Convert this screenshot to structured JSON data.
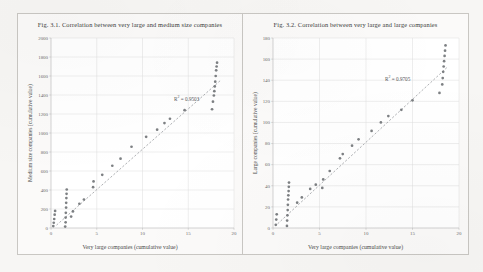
{
  "page": {
    "background_color": "#f7f6f4",
    "panel_background": "#fbfaf9",
    "panel_border_color": "#c9c7c3"
  },
  "figures": [
    {
      "id": "fig-3-1",
      "title": "Fig. 3.1. Correlation between very large and medium size companies",
      "r2_prefix": "R",
      "r2_sup": "2",
      "r2_value": " = 0.9503",
      "r2_text": "R² = 0.9503",
      "chart_data": {
        "type": "scatter",
        "title": "Fig. 3.1. Correlation between very large and medium size companies",
        "xlabel": "Very large companies (cumulative value)",
        "ylabel": "Medium size companies (cumulative value)",
        "xlim": [
          0,
          20
        ],
        "ylim": [
          0,
          2000
        ],
        "xticks": [
          0,
          5,
          10,
          15,
          20
        ],
        "yticks": [
          0,
          200,
          400,
          600,
          800,
          1000,
          1200,
          1400,
          1600,
          1800,
          2000
        ],
        "grid": true,
        "legend": "none",
        "marker_color": "#6f7276",
        "trendline": {
          "style": "dashed",
          "color": "#8c8f93",
          "x0": 0.6,
          "y0": 30,
          "x1": 18.6,
          "y1": 1560
        },
        "points": [
          [
            0.25,
            20
          ],
          [
            0.3,
            55
          ],
          [
            0.35,
            95
          ],
          [
            0.4,
            140
          ],
          [
            0.45,
            180
          ],
          [
            1.55,
            15
          ],
          [
            1.6,
            60
          ],
          [
            1.6,
            110
          ],
          [
            1.62,
            160
          ],
          [
            1.65,
            215
          ],
          [
            1.66,
            265
          ],
          [
            1.68,
            315
          ],
          [
            1.7,
            360
          ],
          [
            1.72,
            405
          ],
          [
            2.2,
            120
          ],
          [
            2.4,
            175
          ],
          [
            3.1,
            255
          ],
          [
            3.6,
            300
          ],
          [
            4.6,
            430
          ],
          [
            4.65,
            490
          ],
          [
            5.6,
            560
          ],
          [
            6.7,
            655
          ],
          [
            7.6,
            730
          ],
          [
            8.8,
            855
          ],
          [
            10.4,
            960
          ],
          [
            11.6,
            1035
          ],
          [
            12.4,
            1105
          ],
          [
            13.0,
            1150
          ],
          [
            14.6,
            1240
          ],
          [
            17.6,
            1250
          ],
          [
            17.7,
            1330
          ],
          [
            17.8,
            1395
          ],
          [
            17.85,
            1440
          ],
          [
            17.9,
            1490
          ],
          [
            17.95,
            1540
          ],
          [
            18.0,
            1600
          ],
          [
            18.05,
            1660
          ],
          [
            18.1,
            1700
          ],
          [
            18.15,
            1740
          ]
        ]
      }
    },
    {
      "id": "fig-3-2",
      "title": "Fig. 3.2. Correlation between very large and large companies",
      "r2_prefix": "R",
      "r2_sup": "2",
      "r2_value": " = 0.9705",
      "r2_text": "R² = 0.9705",
      "chart_data": {
        "type": "scatter",
        "title": "Fig. 3.2. Correlation between very large and large companies",
        "xlabel": "Very large companies (cumulative value)",
        "ylabel": "Large companies (cumulative value)",
        "xlim": [
          0,
          20
        ],
        "ylim": [
          0,
          180
        ],
        "xticks": [
          0,
          5,
          10,
          15,
          20
        ],
        "yticks": [
          0,
          20,
          40,
          60,
          80,
          100,
          120,
          140,
          160,
          180
        ],
        "grid": true,
        "legend": "none",
        "marker_color": "#6f7276",
        "trendline": {
          "style": "dashed",
          "color": "#8c8f93",
          "x0": 0.5,
          "y0": 4,
          "x1": 18.7,
          "y1": 152
        },
        "points": [
          [
            0.3,
            3
          ],
          [
            0.35,
            8
          ],
          [
            0.4,
            13
          ],
          [
            1.5,
            2
          ],
          [
            1.52,
            7
          ],
          [
            1.55,
            12
          ],
          [
            1.58,
            17
          ],
          [
            1.6,
            22
          ],
          [
            1.62,
            27
          ],
          [
            1.65,
            31
          ],
          [
            1.68,
            35
          ],
          [
            1.7,
            39
          ],
          [
            1.72,
            43
          ],
          [
            2.6,
            24
          ],
          [
            3.1,
            29
          ],
          [
            4.0,
            37
          ],
          [
            4.6,
            41
          ],
          [
            5.3,
            38
          ],
          [
            5.4,
            46
          ],
          [
            6.1,
            54
          ],
          [
            7.2,
            66
          ],
          [
            7.5,
            70
          ],
          [
            8.5,
            78
          ],
          [
            9.2,
            84
          ],
          [
            10.6,
            92
          ],
          [
            11.6,
            100
          ],
          [
            12.4,
            106
          ],
          [
            13.8,
            112
          ],
          [
            15.0,
            121
          ],
          [
            17.9,
            128
          ],
          [
            18.2,
            136
          ],
          [
            18.25,
            142
          ],
          [
            18.3,
            148
          ],
          [
            18.35,
            153
          ],
          [
            18.4,
            158
          ],
          [
            18.45,
            163
          ],
          [
            18.5,
            168
          ],
          [
            18.55,
            173
          ]
        ]
      }
    }
  ]
}
